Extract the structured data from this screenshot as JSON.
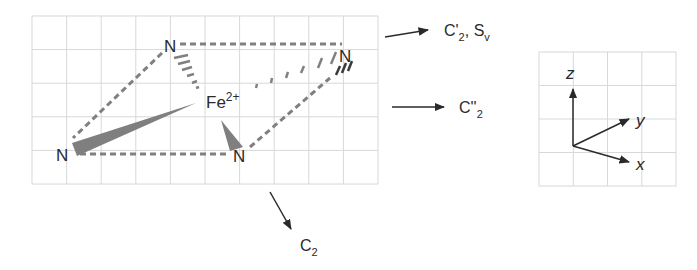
{
  "diagram": {
    "type": "molecular-geometry-symmetry",
    "center_atom": {
      "symbol": "Fe",
      "charge": "2+"
    },
    "ligands": [
      {
        "id": "N_top",
        "label": "N"
      },
      {
        "id": "N_right",
        "label": "N"
      },
      {
        "id": "N_left",
        "label": "N"
      },
      {
        "id": "N_bottom",
        "label": "N"
      }
    ],
    "symmetry_labels": [
      {
        "id": "c2_prime",
        "main": "C'",
        "sub": "2",
        "sep": ", ",
        "main2": "S",
        "sub2": "v"
      },
      {
        "id": "c2_double_prime",
        "main": "C''",
        "sub": "2"
      },
      {
        "id": "c2",
        "main": "C",
        "sub": "2"
      }
    ],
    "axes": {
      "z": "z",
      "y": "y",
      "x": "x"
    },
    "colors": {
      "grid": "#d8d8d8",
      "bond": "#808080",
      "text": "#2a2a2a",
      "arrow": "#2a2a2a"
    }
  }
}
